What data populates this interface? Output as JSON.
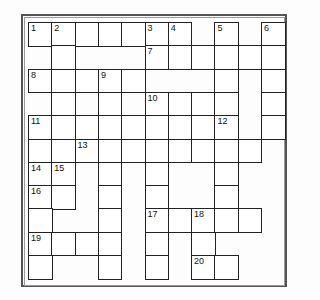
{
  "puzzle": {
    "rows": 11,
    "cols": 11,
    "cell_size": 23.3,
    "border_color": "#222222",
    "cells": [
      {
        "r": 0,
        "c": 0,
        "n": "1"
      },
      {
        "r": 0,
        "c": 1,
        "n": "2"
      },
      {
        "r": 0,
        "c": 2
      },
      {
        "r": 0,
        "c": 3
      },
      {
        "r": 0,
        "c": 4
      },
      {
        "r": 0,
        "c": 5,
        "n": "3"
      },
      {
        "r": 0,
        "c": 6,
        "n": "4"
      },
      {
        "r": 0,
        "c": 8,
        "n": "5"
      },
      {
        "r": 0,
        "c": 10,
        "n": "6"
      },
      {
        "r": 1,
        "c": 1
      },
      {
        "r": 1,
        "c": 5,
        "n": "7"
      },
      {
        "r": 1,
        "c": 6
      },
      {
        "r": 1,
        "c": 7
      },
      {
        "r": 1,
        "c": 8
      },
      {
        "r": 1,
        "c": 9
      },
      {
        "r": 1,
        "c": 10
      },
      {
        "r": 2,
        "c": 0,
        "n": "8"
      },
      {
        "r": 2,
        "c": 1
      },
      {
        "r": 2,
        "c": 2
      },
      {
        "r": 2,
        "c": 3,
        "n": "9"
      },
      {
        "r": 2,
        "c": 4
      },
      {
        "r": 2,
        "c": 8
      },
      {
        "r": 2,
        "c": 10
      },
      {
        "r": 3,
        "c": 1
      },
      {
        "r": 3,
        "c": 3
      },
      {
        "r": 3,
        "c": 5,
        "n": "10"
      },
      {
        "r": 3,
        "c": 6
      },
      {
        "r": 3,
        "c": 7
      },
      {
        "r": 3,
        "c": 8
      },
      {
        "r": 3,
        "c": 10
      },
      {
        "r": 4,
        "c": 0,
        "n": "11"
      },
      {
        "r": 4,
        "c": 1
      },
      {
        "r": 4,
        "c": 2
      },
      {
        "r": 4,
        "c": 3
      },
      {
        "r": 4,
        "c": 4
      },
      {
        "r": 4,
        "c": 5
      },
      {
        "r": 4,
        "c": 6
      },
      {
        "r": 4,
        "c": 7
      },
      {
        "r": 4,
        "c": 8,
        "n": "12"
      },
      {
        "r": 4,
        "c": 10
      },
      {
        "r": 5,
        "c": 0
      },
      {
        "r": 5,
        "c": 1
      },
      {
        "r": 5,
        "c": 2,
        "n": "13"
      },
      {
        "r": 5,
        "c": 3
      },
      {
        "r": 5,
        "c": 4
      },
      {
        "r": 5,
        "c": 5
      },
      {
        "r": 5,
        "c": 6
      },
      {
        "r": 5,
        "c": 7
      },
      {
        "r": 5,
        "c": 8
      },
      {
        "r": 5,
        "c": 9
      },
      {
        "r": 6,
        "c": 0,
        "n": "14"
      },
      {
        "r": 6,
        "c": 1,
        "n": "15"
      },
      {
        "r": 6,
        "c": 3
      },
      {
        "r": 6,
        "c": 5
      },
      {
        "r": 6,
        "c": 8
      },
      {
        "r": 7,
        "c": 0,
        "n": "16"
      },
      {
        "r": 7,
        "c": 1
      },
      {
        "r": 7,
        "c": 3
      },
      {
        "r": 7,
        "c": 5
      },
      {
        "r": 7,
        "c": 8
      },
      {
        "r": 8,
        "c": 0
      },
      {
        "r": 8,
        "c": 3
      },
      {
        "r": 8,
        "c": 5,
        "n": "17"
      },
      {
        "r": 8,
        "c": 6
      },
      {
        "r": 8,
        "c": 7,
        "n": "18"
      },
      {
        "r": 8,
        "c": 8
      },
      {
        "r": 8,
        "c": 9
      },
      {
        "r": 9,
        "c": 0,
        "n": "19"
      },
      {
        "r": 9,
        "c": 1
      },
      {
        "r": 9,
        "c": 2
      },
      {
        "r": 9,
        "c": 3
      },
      {
        "r": 9,
        "c": 5
      },
      {
        "r": 9,
        "c": 7
      },
      {
        "r": 10,
        "c": 0
      },
      {
        "r": 10,
        "c": 3
      },
      {
        "r": 10,
        "c": 5
      },
      {
        "r": 10,
        "c": 7,
        "n": "20"
      },
      {
        "r": 10,
        "c": 8
      }
    ]
  }
}
